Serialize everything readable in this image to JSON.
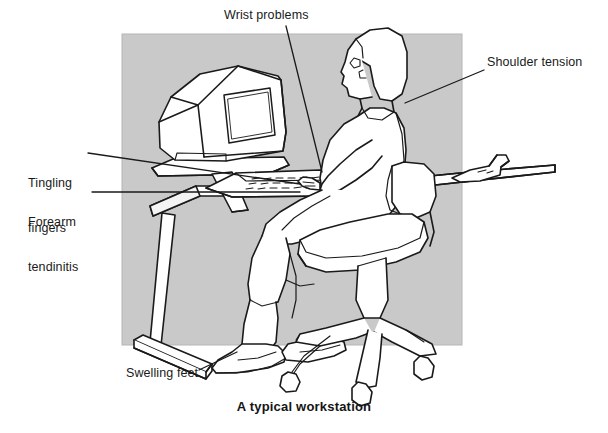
{
  "figure": {
    "caption": "A typical workstation",
    "background_rect_color": "#c9c9c9",
    "line_color": "#1a1a1a",
    "page_color": "#ffffff",
    "labels": [
      {
        "id": "wrist-problems",
        "text": "Wrist problems",
        "x": 224,
        "y": 8
      },
      {
        "id": "shoulder-tension",
        "text": "Shoulder tension",
        "x": 487,
        "y": 55
      },
      {
        "id": "tingling-fingers",
        "text": "Tingling\nfingers",
        "x": 28,
        "y": 146
      },
      {
        "id": "forearm-tendinitis",
        "text": "Forearm\ntendinitis",
        "x": 28,
        "y": 185
      },
      {
        "id": "swelling-feet",
        "text": "Swelling feet",
        "x": 126,
        "y": 366
      }
    ],
    "label_text": {
      "wrist_problems": "Wrist problems",
      "shoulder_tension": "Shoulder tension",
      "tingling_line1": "Tingling",
      "tingling_line2": "fingers",
      "forearm_line1": "Forearm",
      "forearm_line2": "tendinitis",
      "swelling_feet": "Swelling feet"
    },
    "scene_objects": [
      "gray-backdrop-panel",
      "crt-monitor",
      "monitor-stand",
      "keyboard",
      "desk",
      "desk-leg",
      "mouse-device",
      "seated-person",
      "office-chair",
      "chair-castors"
    ]
  }
}
